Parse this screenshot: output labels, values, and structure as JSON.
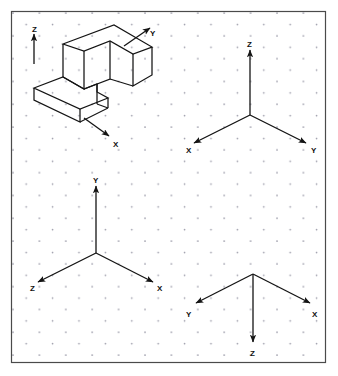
{
  "sheet": {
    "title": "Isometric axis orientation worksheet",
    "background_color": "#ffffff",
    "border_color": "#3a3a3a",
    "line_color": "#141414",
    "grid_dot_color": "#9a9aa8",
    "border": {
      "x": 11,
      "y": 11,
      "width": 315,
      "height": 352
    },
    "grid": {
      "type": "isometric-dot",
      "spacing_x": 13.2,
      "spacing_y": 11.4,
      "dot_radius": 0.85
    }
  },
  "figures": [
    {
      "name": "isometric-solid-figure",
      "label": "L-shaped block with notch",
      "axes": [
        {
          "axis": "Z",
          "label": "Z",
          "direction": "up",
          "label_x": 32,
          "label_y": 26
        },
        {
          "axis": "Y",
          "label": "Y",
          "direction": "up-right",
          "label_x": 150,
          "label_y": 30
        },
        {
          "axis": "X",
          "label": "X",
          "direction": "down-right",
          "label_x": 113,
          "label_y": 141
        }
      ]
    },
    {
      "name": "axis-triad-top-right",
      "label": "Axis triad 2",
      "axes": [
        {
          "axis": "Z",
          "label": "Z",
          "direction": "up",
          "label_x": 247,
          "label_y": 41
        },
        {
          "axis": "X",
          "label": "X",
          "direction": "down-left",
          "label_x": 186,
          "label_y": 147
        },
        {
          "axis": "Y",
          "label": "Y",
          "direction": "down-right",
          "label_x": 311,
          "label_y": 147
        }
      ]
    },
    {
      "name": "axis-triad-bottom-left",
      "label": "Axis triad 3",
      "axes": [
        {
          "axis": "Y",
          "label": "Y",
          "direction": "up",
          "label_x": 93,
          "label_y": 177
        },
        {
          "axis": "Z",
          "label": "Z",
          "direction": "down-left",
          "label_x": 30,
          "label_y": 285
        },
        {
          "axis": "X",
          "label": "X",
          "direction": "down-right",
          "label_x": 157,
          "label_y": 285
        }
      ]
    },
    {
      "name": "axis-triad-bottom-right",
      "label": "Axis triad 4",
      "axes": [
        {
          "axis": "Y",
          "label": "Y",
          "direction": "down-left",
          "label_x": 186,
          "label_y": 311
        },
        {
          "axis": "X",
          "label": "X",
          "direction": "down-right",
          "label_x": 312,
          "label_y": 311
        },
        {
          "axis": "Z",
          "label": "Z",
          "direction": "down",
          "label_x": 250,
          "label_y": 350
        }
      ]
    }
  ]
}
